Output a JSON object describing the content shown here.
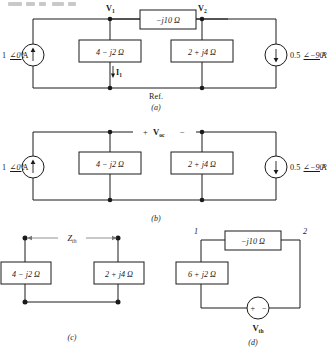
{
  "figure": {
    "panels": [
      {
        "id": "a",
        "caption": "(a)",
        "nodes": [
          {
            "name": "V",
            "sub": "1"
          },
          {
            "name": "V",
            "sub": "2"
          }
        ],
        "reference_label": "Ref.",
        "series_element": "−j10 Ω",
        "impedances": [
          "4 − j2 Ω",
          "2 + j4 Ω"
        ],
        "sources": [
          {
            "label": "1",
            "angle": "0°",
            "unit": "A",
            "direction": "up"
          },
          {
            "label": "0.5",
            "angle": "−90°",
            "unit": "A",
            "direction": "down"
          }
        ],
        "branch_current": {
          "name": "I",
          "sub": "1",
          "direction": "down"
        }
      },
      {
        "id": "b",
        "caption": "(b)",
        "open_circuit": {
          "plus": "+",
          "minus": "−",
          "name": "V",
          "sub": "oc"
        },
        "impedances": [
          "4 − j2 Ω",
          "2 + j4 Ω"
        ],
        "sources": [
          {
            "label": "1",
            "angle": "0°",
            "unit": "A",
            "direction": "up"
          },
          {
            "label": "0.5",
            "angle": "−90°",
            "unit": "A",
            "direction": "down"
          }
        ]
      },
      {
        "id": "c",
        "caption": "(c)",
        "dimension": {
          "name": "Z",
          "sub": "th"
        },
        "impedances": [
          "4 − j2 Ω",
          "2 + j4 Ω"
        ]
      },
      {
        "id": "d",
        "caption": "(d)",
        "nodes": [
          "1",
          "2"
        ],
        "series_element": "−j10 Ω",
        "impedances": [
          "6 + j2 Ω"
        ],
        "source": {
          "name": "V",
          "sub": "th",
          "plus": "+",
          "minus": "−"
        }
      }
    ]
  },
  "colors": {
    "ink": "#1a1a1a",
    "paper": "#ffffff",
    "dim": "#777777"
  }
}
